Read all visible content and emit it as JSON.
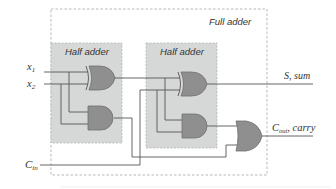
{
  "diagram": {
    "type": "logic-circuit",
    "title": "Full adder",
    "blocks": [
      {
        "id": "ha1",
        "label": "Half adder"
      },
      {
        "id": "ha2",
        "label": "Half adder"
      }
    ],
    "inputs": {
      "x1": {
        "base": "x",
        "sub": "1"
      },
      "x2": {
        "base": "x",
        "sub": "2"
      },
      "cin": {
        "base": "C",
        "sub": "in"
      }
    },
    "outputs": {
      "sum": {
        "text": "S, sum"
      },
      "carry": {
        "base": "C",
        "sub": "out",
        "suffix": ", carry"
      }
    },
    "gates": [
      {
        "id": "xor1",
        "type": "XOR",
        "block": "ha1"
      },
      {
        "id": "and1",
        "type": "AND",
        "block": "ha1"
      },
      {
        "id": "xor2",
        "type": "XOR",
        "block": "ha2"
      },
      {
        "id": "and2",
        "type": "AND",
        "block": "ha2"
      },
      {
        "id": "or1",
        "type": "OR",
        "block": "full-adder"
      }
    ],
    "colors": {
      "half_adder_fill": "#d6d8d7",
      "gate_fill": "#8f8f8f",
      "wire": "#555555",
      "border": "#b0b0b0"
    }
  }
}
